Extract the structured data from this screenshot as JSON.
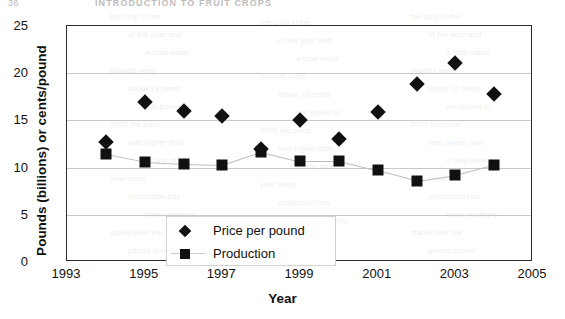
{
  "page": {
    "folio": "36",
    "running_head": "INTRODUCTION TO FRUIT CROPS"
  },
  "chart_data": {
    "type": "scatter",
    "title": "",
    "xlabel": "Year",
    "ylabel": "Pounds (billions) or cents/pound",
    "xlim": [
      1993,
      2005
    ],
    "ylim": [
      0,
      25
    ],
    "x_ticks": [
      "1993",
      "1995",
      "1997",
      "1999",
      "2001",
      "2003",
      "2005"
    ],
    "x_tick_values": [
      1993,
      1995,
      1997,
      1999,
      2001,
      2003,
      2005
    ],
    "y_ticks": [
      "0",
      "5",
      "10",
      "15",
      "20",
      "25"
    ],
    "y_tick_values": [
      0,
      5,
      10,
      15,
      20,
      25
    ],
    "grid": "horizontal",
    "legend_position": "inside-lower-left",
    "x": [
      1994,
      1995,
      1996,
      1997,
      1998,
      1999,
      2000,
      2001,
      2002,
      2003,
      2004
    ],
    "series": [
      {
        "name": "Price per pound",
        "marker": "diamond",
        "color": "#111111",
        "values": [
          12.7,
          17.0,
          16.0,
          15.5,
          12.0,
          15.0,
          13.0,
          15.9,
          18.9,
          21.1,
          17.8
        ]
      },
      {
        "name": "Production",
        "marker": "square",
        "color": "#111111",
        "values": [
          11.4,
          10.6,
          10.4,
          10.3,
          11.7,
          10.7,
          10.7,
          9.7,
          8.6,
          9.2,
          10.3
        ]
      }
    ]
  },
  "bleed_text": [
    "the  crop  in  the",
    "of  the  year  and",
    "a  total  value",
    "pounds  were",
    "about  18  cents",
    "per  pound  in",
    "2003  the  price",
    "was  higher  than",
    "in  any  other",
    "year  since",
    "production  has",
    "been  relatively",
    "stable  over  the",
    "period  shown"
  ]
}
